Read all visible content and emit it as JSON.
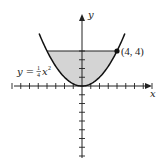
{
  "chart_data": {
    "type": "area",
    "title": "",
    "xlabel": "x",
    "ylabel": "y",
    "curve": {
      "equation": "y = (1/4)x^2",
      "label": "y = ¼x²"
    },
    "region": {
      "description": "area between y = (1/4)x^2 and y = 4",
      "bounds_x": [
        -4,
        4
      ],
      "bounds_y": [
        0,
        4
      ],
      "fill": "#d4d4d4"
    },
    "point": {
      "x": 4,
      "y": 4,
      "label": "(4, 4)"
    },
    "xlim": [
      -9,
      9
    ],
    "ylim": [
      -9,
      5
    ],
    "x_ticks": [
      -8,
      -7,
      -6,
      -5,
      -4,
      -3,
      -2,
      -1,
      1,
      2,
      3,
      4,
      5,
      6,
      7,
      8
    ],
    "y_ticks": [
      -8,
      -7,
      -6,
      -5,
      -4,
      -3,
      -2,
      -1,
      1,
      2,
      3,
      4
    ],
    "grid": false,
    "colors": {
      "curve": "#111111",
      "axis": "#222222",
      "fill": "#d4d4d4"
    }
  },
  "labels": {
    "x_axis": "x",
    "y_axis": "y",
    "point": "(4, 4)",
    "equation_prefix": "y = ",
    "equation_num": "1",
    "equation_den": "4",
    "equation_var": "x",
    "equation_exp": "2"
  }
}
